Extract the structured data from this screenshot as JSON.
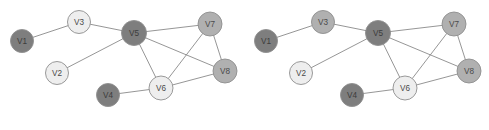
{
  "figure": {
    "background": "#ffffff",
    "width": 489,
    "height": 130,
    "caption": ""
  },
  "palette": {
    "dark": "#7e7e7e",
    "medium": "#b0b0b0",
    "light": "#eeeeee",
    "node_stroke": "#8f8f8f",
    "edge_stroke": "#8a8a8a",
    "label_color": "#4a4a4a"
  },
  "graphs": [
    {
      "id": "graph-left",
      "name": "left-graph",
      "origin_x": 0,
      "nodes": [
        {
          "id": "V1",
          "label": "V1",
          "cx": 22,
          "cy": 41,
          "r": 11.5,
          "shade": "dark"
        },
        {
          "id": "V2",
          "label": "V2",
          "cx": 57,
          "cy": 73,
          "r": 11.5,
          "shade": "light"
        },
        {
          "id": "V3",
          "label": "V3",
          "cx": 79,
          "cy": 22,
          "r": 11.5,
          "shade": "light"
        },
        {
          "id": "V4",
          "label": "V4",
          "cx": 108,
          "cy": 95,
          "r": 11.5,
          "shade": "dark"
        },
        {
          "id": "V5",
          "label": "V5",
          "cx": 134,
          "cy": 33,
          "r": 12.5,
          "shade": "dark"
        },
        {
          "id": "V6",
          "label": "V6",
          "cx": 161,
          "cy": 88,
          "r": 12.0,
          "shade": "light"
        },
        {
          "id": "V7",
          "label": "V7",
          "cx": 210,
          "cy": 24,
          "r": 12.0,
          "shade": "medium"
        },
        {
          "id": "V8",
          "label": "V8",
          "cx": 225,
          "cy": 71,
          "r": 12.0,
          "shade": "medium"
        }
      ],
      "edges": [
        {
          "source": "V1",
          "target": "V3"
        },
        {
          "source": "V2",
          "target": "V5"
        },
        {
          "source": "V3",
          "target": "V5"
        },
        {
          "source": "V4",
          "target": "V6"
        },
        {
          "source": "V5",
          "target": "V6"
        },
        {
          "source": "V5",
          "target": "V7"
        },
        {
          "source": "V5",
          "target": "V8"
        },
        {
          "source": "V6",
          "target": "V7"
        },
        {
          "source": "V6",
          "target": "V8"
        },
        {
          "source": "V7",
          "target": "V8"
        }
      ]
    },
    {
      "id": "graph-right",
      "name": "right-graph",
      "origin_x": 244,
      "nodes": [
        {
          "id": "V1",
          "label": "V1",
          "cx": 266,
          "cy": 41,
          "r": 11.5,
          "shade": "dark"
        },
        {
          "id": "V2",
          "label": "V2",
          "cx": 301,
          "cy": 73,
          "r": 11.5,
          "shade": "light"
        },
        {
          "id": "V3",
          "label": "V3",
          "cx": 323,
          "cy": 22,
          "r": 11.5,
          "shade": "medium"
        },
        {
          "id": "V4",
          "label": "V4",
          "cx": 352,
          "cy": 95,
          "r": 11.5,
          "shade": "dark"
        },
        {
          "id": "V5",
          "label": "V5",
          "cx": 378,
          "cy": 33,
          "r": 12.5,
          "shade": "dark"
        },
        {
          "id": "V6",
          "label": "V6",
          "cx": 405,
          "cy": 88,
          "r": 12.0,
          "shade": "light"
        },
        {
          "id": "V7",
          "label": "V7",
          "cx": 454,
          "cy": 24,
          "r": 12.0,
          "shade": "medium"
        },
        {
          "id": "V8",
          "label": "V8",
          "cx": 469,
          "cy": 71,
          "r": 12.0,
          "shade": "medium"
        }
      ],
      "edges": [
        {
          "source": "V1",
          "target": "V3"
        },
        {
          "source": "V2",
          "target": "V5"
        },
        {
          "source": "V3",
          "target": "V5"
        },
        {
          "source": "V4",
          "target": "V6"
        },
        {
          "source": "V5",
          "target": "V6"
        },
        {
          "source": "V5",
          "target": "V7"
        },
        {
          "source": "V5",
          "target": "V8"
        },
        {
          "source": "V6",
          "target": "V7"
        },
        {
          "source": "V6",
          "target": "V8"
        },
        {
          "source": "V7",
          "target": "V8"
        }
      ]
    }
  ]
}
